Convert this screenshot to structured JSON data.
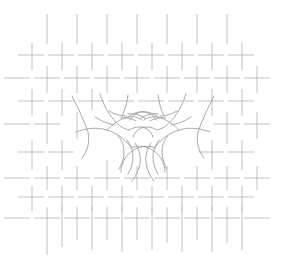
{
  "artwork": {
    "title": "Two Hands Reaching",
    "description": "Minimal line drawing of two hands reaching toward one another over a basket-weave hatch field",
    "canvas": {
      "width": 286,
      "height": 271,
      "background_color": "#ffffff"
    },
    "weave": {
      "name": "basket-weave-hatch-field",
      "stroke_color": "#b9b9bd",
      "stroke_width": 0.9,
      "dash_length": 26,
      "pitch_x": 30,
      "pitch_y": 30,
      "origin_x": 14,
      "origin_y": 10,
      "columns": 10,
      "rows": 9,
      "horizontal_segments": [
        {
          "x1": 18,
          "y1": 55,
          "x2": 44,
          "y2": 55
        },
        {
          "x1": 48,
          "y1": 55,
          "x2": 74,
          "y2": 55
        },
        {
          "x1": 78,
          "y1": 55,
          "x2": 104,
          "y2": 55
        },
        {
          "x1": 108,
          "y1": 55,
          "x2": 134,
          "y2": 55
        },
        {
          "x1": 138,
          "y1": 55,
          "x2": 164,
          "y2": 55
        },
        {
          "x1": 168,
          "y1": 55,
          "x2": 194,
          "y2": 55
        },
        {
          "x1": 198,
          "y1": 55,
          "x2": 224,
          "y2": 55
        },
        {
          "x1": 228,
          "y1": 55,
          "x2": 254,
          "y2": 55
        },
        {
          "x1": 4,
          "y1": 78,
          "x2": 30,
          "y2": 78
        },
        {
          "x1": 34,
          "y1": 78,
          "x2": 60,
          "y2": 78
        },
        {
          "x1": 64,
          "y1": 78,
          "x2": 90,
          "y2": 78
        },
        {
          "x1": 94,
          "y1": 78,
          "x2": 120,
          "y2": 78
        },
        {
          "x1": 124,
          "y1": 78,
          "x2": 150,
          "y2": 78
        },
        {
          "x1": 154,
          "y1": 78,
          "x2": 180,
          "y2": 78
        },
        {
          "x1": 184,
          "y1": 78,
          "x2": 210,
          "y2": 78
        },
        {
          "x1": 214,
          "y1": 78,
          "x2": 240,
          "y2": 78
        },
        {
          "x1": 244,
          "y1": 78,
          "x2": 270,
          "y2": 78
        },
        {
          "x1": 18,
          "y1": 101,
          "x2": 44,
          "y2": 101
        },
        {
          "x1": 48,
          "y1": 101,
          "x2": 74,
          "y2": 101
        },
        {
          "x1": 78,
          "y1": 101,
          "x2": 104,
          "y2": 101
        },
        {
          "x1": 108,
          "y1": 101,
          "x2": 134,
          "y2": 101
        },
        {
          "x1": 138,
          "y1": 101,
          "x2": 164,
          "y2": 101
        },
        {
          "x1": 168,
          "y1": 101,
          "x2": 194,
          "y2": 101
        },
        {
          "x1": 198,
          "y1": 101,
          "x2": 224,
          "y2": 101
        },
        {
          "x1": 228,
          "y1": 101,
          "x2": 254,
          "y2": 101
        },
        {
          "x1": 4,
          "y1": 124,
          "x2": 30,
          "y2": 124
        },
        {
          "x1": 34,
          "y1": 124,
          "x2": 60,
          "y2": 124
        },
        {
          "x1": 214,
          "y1": 124,
          "x2": 240,
          "y2": 124
        },
        {
          "x1": 244,
          "y1": 124,
          "x2": 270,
          "y2": 124
        },
        {
          "x1": 18,
          "y1": 152,
          "x2": 44,
          "y2": 152
        },
        {
          "x1": 48,
          "y1": 152,
          "x2": 74,
          "y2": 152
        },
        {
          "x1": 198,
          "y1": 152,
          "x2": 224,
          "y2": 152
        },
        {
          "x1": 228,
          "y1": 152,
          "x2": 254,
          "y2": 152
        },
        {
          "x1": 4,
          "y1": 178,
          "x2": 30,
          "y2": 178
        },
        {
          "x1": 34,
          "y1": 178,
          "x2": 60,
          "y2": 178
        },
        {
          "x1": 64,
          "y1": 178,
          "x2": 90,
          "y2": 178
        },
        {
          "x1": 94,
          "y1": 178,
          "x2": 120,
          "y2": 178
        },
        {
          "x1": 124,
          "y1": 178,
          "x2": 150,
          "y2": 178
        },
        {
          "x1": 154,
          "y1": 178,
          "x2": 180,
          "y2": 178
        },
        {
          "x1": 184,
          "y1": 178,
          "x2": 210,
          "y2": 178
        },
        {
          "x1": 214,
          "y1": 178,
          "x2": 240,
          "y2": 178
        },
        {
          "x1": 244,
          "y1": 178,
          "x2": 270,
          "y2": 178
        },
        {
          "x1": 18,
          "y1": 197,
          "x2": 44,
          "y2": 197
        },
        {
          "x1": 48,
          "y1": 197,
          "x2": 74,
          "y2": 197
        },
        {
          "x1": 78,
          "y1": 197,
          "x2": 104,
          "y2": 197
        },
        {
          "x1": 108,
          "y1": 197,
          "x2": 134,
          "y2": 197
        },
        {
          "x1": 138,
          "y1": 197,
          "x2": 164,
          "y2": 197
        },
        {
          "x1": 168,
          "y1": 197,
          "x2": 194,
          "y2": 197
        },
        {
          "x1": 198,
          "y1": 197,
          "x2": 224,
          "y2": 197
        },
        {
          "x1": 228,
          "y1": 197,
          "x2": 254,
          "y2": 197
        },
        {
          "x1": 4,
          "y1": 218,
          "x2": 30,
          "y2": 218
        },
        {
          "x1": 34,
          "y1": 218,
          "x2": 60,
          "y2": 218
        },
        {
          "x1": 64,
          "y1": 218,
          "x2": 90,
          "y2": 218
        },
        {
          "x1": 94,
          "y1": 218,
          "x2": 120,
          "y2": 218
        },
        {
          "x1": 124,
          "y1": 218,
          "x2": 150,
          "y2": 218
        },
        {
          "x1": 154,
          "y1": 218,
          "x2": 180,
          "y2": 218
        },
        {
          "x1": 184,
          "y1": 218,
          "x2": 210,
          "y2": 218
        },
        {
          "x1": 214,
          "y1": 218,
          "x2": 240,
          "y2": 218
        },
        {
          "x1": 244,
          "y1": 218,
          "x2": 270,
          "y2": 218
        }
      ],
      "vertical_segments": [
        {
          "x1": 47,
          "y1": 14,
          "x2": 47,
          "y2": 44
        },
        {
          "x1": 77,
          "y1": 14,
          "x2": 77,
          "y2": 44
        },
        {
          "x1": 107,
          "y1": 14,
          "x2": 107,
          "y2": 44
        },
        {
          "x1": 137,
          "y1": 14,
          "x2": 137,
          "y2": 44
        },
        {
          "x1": 167,
          "y1": 14,
          "x2": 167,
          "y2": 44
        },
        {
          "x1": 197,
          "y1": 14,
          "x2": 197,
          "y2": 44
        },
        {
          "x1": 227,
          "y1": 14,
          "x2": 227,
          "y2": 44
        },
        {
          "x1": 32,
          "y1": 43,
          "x2": 32,
          "y2": 70
        },
        {
          "x1": 62,
          "y1": 43,
          "x2": 62,
          "y2": 70
        },
        {
          "x1": 92,
          "y1": 43,
          "x2": 92,
          "y2": 70
        },
        {
          "x1": 122,
          "y1": 43,
          "x2": 122,
          "y2": 70
        },
        {
          "x1": 152,
          "y1": 43,
          "x2": 152,
          "y2": 70
        },
        {
          "x1": 182,
          "y1": 43,
          "x2": 182,
          "y2": 70
        },
        {
          "x1": 212,
          "y1": 43,
          "x2": 212,
          "y2": 70
        },
        {
          "x1": 242,
          "y1": 43,
          "x2": 242,
          "y2": 70
        },
        {
          "x1": 47,
          "y1": 66,
          "x2": 47,
          "y2": 93
        },
        {
          "x1": 77,
          "y1": 66,
          "x2": 77,
          "y2": 93
        },
        {
          "x1": 107,
          "y1": 66,
          "x2": 107,
          "y2": 93
        },
        {
          "x1": 137,
          "y1": 66,
          "x2": 137,
          "y2": 93
        },
        {
          "x1": 167,
          "y1": 66,
          "x2": 167,
          "y2": 93
        },
        {
          "x1": 197,
          "y1": 66,
          "x2": 197,
          "y2": 93
        },
        {
          "x1": 227,
          "y1": 66,
          "x2": 227,
          "y2": 93
        },
        {
          "x1": 257,
          "y1": 66,
          "x2": 257,
          "y2": 93
        },
        {
          "x1": 32,
          "y1": 89,
          "x2": 32,
          "y2": 116
        },
        {
          "x1": 62,
          "y1": 89,
          "x2": 62,
          "y2": 116
        },
        {
          "x1": 92,
          "y1": 89,
          "x2": 92,
          "y2": 110
        },
        {
          "x1": 212,
          "y1": 89,
          "x2": 212,
          "y2": 116
        },
        {
          "x1": 242,
          "y1": 89,
          "x2": 242,
          "y2": 116
        },
        {
          "x1": 47,
          "y1": 112,
          "x2": 47,
          "y2": 144
        },
        {
          "x1": 77,
          "y1": 112,
          "x2": 77,
          "y2": 139
        },
        {
          "x1": 227,
          "y1": 112,
          "x2": 227,
          "y2": 144
        },
        {
          "x1": 257,
          "y1": 112,
          "x2": 257,
          "y2": 139
        },
        {
          "x1": 32,
          "y1": 140,
          "x2": 32,
          "y2": 170
        },
        {
          "x1": 62,
          "y1": 140,
          "x2": 62,
          "y2": 170
        },
        {
          "x1": 212,
          "y1": 140,
          "x2": 212,
          "y2": 170
        },
        {
          "x1": 242,
          "y1": 140,
          "x2": 242,
          "y2": 170
        },
        {
          "x1": 47,
          "y1": 166,
          "x2": 47,
          "y2": 190
        },
        {
          "x1": 77,
          "y1": 166,
          "x2": 77,
          "y2": 190
        },
        {
          "x1": 107,
          "y1": 160,
          "x2": 107,
          "y2": 190
        },
        {
          "x1": 137,
          "y1": 166,
          "x2": 137,
          "y2": 190
        },
        {
          "x1": 167,
          "y1": 166,
          "x2": 167,
          "y2": 190
        },
        {
          "x1": 197,
          "y1": 166,
          "x2": 197,
          "y2": 190
        },
        {
          "x1": 227,
          "y1": 166,
          "x2": 227,
          "y2": 190
        },
        {
          "x1": 257,
          "y1": 166,
          "x2": 257,
          "y2": 190
        },
        {
          "x1": 32,
          "y1": 186,
          "x2": 32,
          "y2": 211
        },
        {
          "x1": 62,
          "y1": 186,
          "x2": 62,
          "y2": 211
        },
        {
          "x1": 92,
          "y1": 186,
          "x2": 92,
          "y2": 211
        },
        {
          "x1": 122,
          "y1": 186,
          "x2": 122,
          "y2": 211
        },
        {
          "x1": 152,
          "y1": 186,
          "x2": 152,
          "y2": 211
        },
        {
          "x1": 182,
          "y1": 186,
          "x2": 182,
          "y2": 211
        },
        {
          "x1": 212,
          "y1": 186,
          "x2": 212,
          "y2": 211
        },
        {
          "x1": 242,
          "y1": 186,
          "x2": 242,
          "y2": 211
        },
        {
          "x1": 47,
          "y1": 207,
          "x2": 47,
          "y2": 255
        },
        {
          "x1": 62,
          "y1": 207,
          "x2": 62,
          "y2": 247
        },
        {
          "x1": 77,
          "y1": 207,
          "x2": 77,
          "y2": 240
        },
        {
          "x1": 92,
          "y1": 207,
          "x2": 92,
          "y2": 250
        },
        {
          "x1": 107,
          "y1": 207,
          "x2": 107,
          "y2": 240
        },
        {
          "x1": 122,
          "y1": 207,
          "x2": 122,
          "y2": 252
        },
        {
          "x1": 137,
          "y1": 207,
          "x2": 137,
          "y2": 240
        },
        {
          "x1": 152,
          "y1": 207,
          "x2": 152,
          "y2": 250
        },
        {
          "x1": 167,
          "y1": 207,
          "x2": 167,
          "y2": 243
        },
        {
          "x1": 182,
          "y1": 207,
          "x2": 182,
          "y2": 252
        },
        {
          "x1": 197,
          "y1": 207,
          "x2": 197,
          "y2": 240
        },
        {
          "x1": 212,
          "y1": 207,
          "x2": 212,
          "y2": 252
        },
        {
          "x1": 227,
          "y1": 207,
          "x2": 227,
          "y2": 243
        },
        {
          "x1": 242,
          "y1": 207,
          "x2": 242,
          "y2": 250
        }
      ]
    },
    "hands": {
      "name": "two-hands-reaching",
      "stroke_color": "#9a9aa0",
      "stroke_width": 0.85,
      "left_hand": {
        "label": "left-hand",
        "paths": [
          "M 72 96 C 78 108, 84 120, 88 132 C 90 141, 88 150, 82 158",
          "M 100 94 C 103 104, 108 113, 114 120 C 119 126, 124 129, 129 130",
          "M 128 95 C 127 103, 125 110, 122 116",
          "M 76 132 C 86 128, 97 127, 107 130 C 116 133, 124 138, 130 146",
          "M 107 130 C 113 124, 120 119, 128 117 C 133 116, 138 117, 142 120",
          "M 128 117 C 133 113, 139 111, 145 112 C 150 113, 154 116, 156 120",
          "M 129 130 C 134 127, 140 126, 145 128 C 149 130, 152 133, 153 137",
          "M 118 136 C 122 140, 124 146, 124 152 C 124 158, 122 164, 119 169",
          "M 127 140 C 131 145, 133 151, 133 157 C 133 163, 131 169, 128 174",
          "M 135 143 C 139 149, 141 156, 140 163 C 139 170, 136 176, 132 181",
          "M 130 148 C 138 145, 147 146, 154 151 C 161 156, 165 164, 165 172",
          "M 141 118 C 146 115, 152 113, 158 114",
          "M 150 121 C 155 118, 161 117, 166 118",
          "M 109 111 C 114 114, 120 116, 126 116",
          "M 95 117 C 101 121, 108 124, 115 125"
        ]
      },
      "right_hand": {
        "label": "right-hand",
        "paths": [
          "M 214 96 C 208 108, 202 120, 198 132 C 196 141, 198 150, 204 158",
          "M 186 94 C 183 104, 178 113, 172 120 C 167 126, 162 129, 157 130",
          "M 158 95 C 159 103, 161 110, 164 116",
          "M 210 132 C 200 128, 189 127, 179 130 C 170 133, 162 138, 156 146",
          "M 179 130 C 173 124, 166 119, 158 117 C 153 116, 148 117, 144 120",
          "M 158 117 C 153 113, 147 111, 141 112 C 136 113, 132 116, 130 120",
          "M 157 130 C 152 127, 146 126, 141 128 C 137 130, 134 133, 133 137",
          "M 168 136 C 164 140, 162 146, 162 152 C 162 158, 164 164, 167 169",
          "M 159 140 C 155 145, 153 151, 153 157 C 153 163, 155 169, 158 174",
          "M 151 143 C 147 149, 145 156, 146 163 C 147 170, 150 176, 154 181",
          "M 156 148 C 148 145, 139 146, 132 151 C 125 156, 121 164, 121 172",
          "M 145 118 C 140 115, 134 113, 128 114",
          "M 136 121 C 131 118, 125 117, 120 118",
          "M 177 111 C 172 114, 166 116, 160 116",
          "M 191 117 C 185 121, 178 124, 171 125"
        ]
      }
    }
  }
}
